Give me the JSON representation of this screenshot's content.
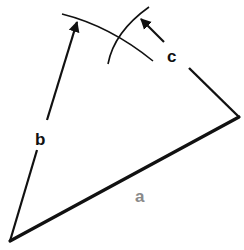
{
  "diagram": {
    "labels": {
      "a": "a",
      "b": "b",
      "c": "c"
    },
    "colors": {
      "line": "#111111",
      "label_dark": "#111111",
      "label_a": "#8a8a8a",
      "background": "#ffffff"
    },
    "points": {
      "vertex_left": [
        10,
        241
      ],
      "vertex_right": [
        239,
        117
      ],
      "arc_intersection": [
        122,
        38
      ]
    }
  }
}
